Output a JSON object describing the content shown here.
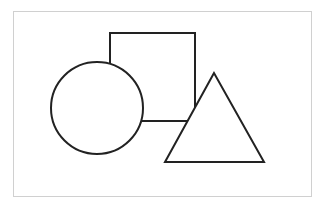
{
  "diagram": {
    "frame": {
      "x": 13.5,
      "y": 11.5,
      "width": 298,
      "height": 185,
      "stroke": "#d0d0d0",
      "stroke_width": 1
    },
    "stroke_color": "#222222",
    "fill_color": "#ffffff",
    "shapes": [
      {
        "type": "square",
        "x": 110,
        "y": 33,
        "width": 85,
        "height": 88
      },
      {
        "type": "circle",
        "cx": 97,
        "cy": 108,
        "r": 46
      },
      {
        "type": "triangle",
        "points": "214,73 165,162 264,162"
      }
    ]
  }
}
